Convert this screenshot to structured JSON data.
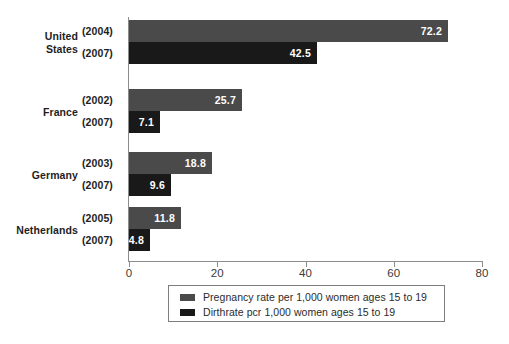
{
  "chart_data": {
    "type": "bar",
    "orientation": "horizontal",
    "title": "",
    "xlabel": "",
    "ylabel": "",
    "xlim": [
      0,
      80
    ],
    "xticks": [
      0,
      20,
      40,
      60,
      80
    ],
    "grid": false,
    "legend_position": "bottom",
    "categories": [
      "United States",
      "France",
      "Germany",
      "Netherlands"
    ],
    "series": [
      {
        "name": "Pregnancy rate per 1,000 women ages 15 to 19",
        "color": "#4a4a4a",
        "years": [
          "(2004)",
          "(2002)",
          "(2003)",
          "(2005)"
        ],
        "values": [
          72.2,
          25.7,
          18.8,
          11.8
        ]
      },
      {
        "name": "Dirthrate pcr 1,000 women ages 15 to 19",
        "color": "#191919",
        "years": [
          "(2007)",
          "(2007)",
          "(2007)",
          "(2007)"
        ],
        "values": [
          42.5,
          7.1,
          9.6,
          4.8
        ]
      }
    ],
    "groups": [
      {
        "country_line1": "United",
        "country_line2": "States",
        "bars": [
          {
            "year": "(2004)",
            "value": 72.2,
            "value_label": "72.2",
            "series": "pregnancy"
          },
          {
            "year": "(2007)",
            "value": 42.5,
            "value_label": "42.5",
            "series": "birth"
          }
        ]
      },
      {
        "country_line1": "France",
        "country_line2": "",
        "bars": [
          {
            "year": "(2002)",
            "value": 25.7,
            "value_label": "25.7",
            "series": "pregnancy"
          },
          {
            "year": "(2007)",
            "value": 7.1,
            "value_label": "7.1",
            "series": "birth"
          }
        ]
      },
      {
        "country_line1": "Germany",
        "country_line2": "",
        "bars": [
          {
            "year": "(2003)",
            "value": 18.8,
            "value_label": "18.8",
            "series": "pregnancy"
          },
          {
            "year": "(2007)",
            "value": 9.6,
            "value_label": "9.6",
            "series": "birth"
          }
        ]
      },
      {
        "country_line1": "Netherlands",
        "country_line2": "",
        "bars": [
          {
            "year": "(2005)",
            "value": 11.8,
            "value_label": "11.8",
            "series": "pregnancy"
          },
          {
            "year": "(2007)",
            "value": 4.8,
            "value_label": "4.8",
            "series": "birth"
          }
        ]
      }
    ]
  },
  "axis": {
    "tick_labels": [
      "0",
      "20",
      "40",
      "60",
      "80"
    ]
  },
  "legend": {
    "items": [
      {
        "label": "Pregnancy rate per 1,000 women ages 15 to 19",
        "swatch": "pregnancy"
      },
      {
        "label": "Dirthrate pcr 1,000 women ages 15 to 19",
        "swatch": "birth"
      }
    ]
  },
  "colors": {
    "pregnancy": "#4a4a4a",
    "birth": "#191919",
    "axis": "#8c8c8c",
    "text": "#1e1e1e",
    "background": "#ffffff"
  }
}
